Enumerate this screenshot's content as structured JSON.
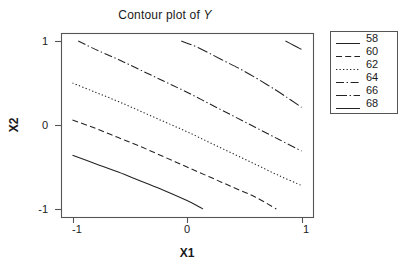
{
  "chart_data": {
    "type": "line",
    "title": "Contour plot of Y",
    "title_prefix": "Contour plot of ",
    "title_variable": "Y",
    "xlabel": "X1",
    "ylabel": "X2",
    "xlim": [
      -1.3,
      1.3
    ],
    "ylim": [
      -1.15,
      1.15
    ],
    "xticks": [
      -1,
      0,
      1
    ],
    "xtick_labels": [
      "-1",
      "0",
      "1"
    ],
    "yticks": [
      -1,
      0,
      1
    ],
    "ytick_labels": [
      "-1",
      "0",
      "1"
    ],
    "grid": false,
    "legend_position": "right-outside",
    "legend_title": "",
    "axis_color": "#555555",
    "line_color": "#222222",
    "background": "#ffffff",
    "contour_levels": [
      58,
      60,
      62,
      64,
      66,
      68
    ],
    "series": [
      {
        "name": "58",
        "level": 58,
        "dash": "solid",
        "points": [
          [
            -1.0,
            -0.36
          ],
          [
            -0.8,
            -0.46
          ],
          [
            -0.6,
            -0.56
          ],
          [
            -0.4,
            -0.67
          ],
          [
            -0.2,
            -0.78
          ],
          [
            0.0,
            -0.9
          ],
          [
            0.1,
            -0.97
          ],
          [
            0.14,
            -1.0
          ]
        ]
      },
      {
        "name": "60",
        "level": 60,
        "dash": "dashed",
        "points": [
          [
            -1.0,
            0.06
          ],
          [
            -0.8,
            -0.04
          ],
          [
            -0.6,
            -0.15
          ],
          [
            -0.4,
            -0.26
          ],
          [
            -0.2,
            -0.38
          ],
          [
            0.0,
            -0.5
          ],
          [
            0.2,
            -0.62
          ],
          [
            0.4,
            -0.74
          ],
          [
            0.6,
            -0.86
          ],
          [
            0.78,
            -1.0
          ]
        ]
      },
      {
        "name": "62",
        "level": 62,
        "dash": "dotted",
        "points": [
          [
            -1.0,
            0.5
          ],
          [
            -0.8,
            0.39
          ],
          [
            -0.6,
            0.28
          ],
          [
            -0.4,
            0.16
          ],
          [
            -0.2,
            0.04
          ],
          [
            0.0,
            -0.08
          ],
          [
            0.2,
            -0.21
          ],
          [
            0.4,
            -0.34
          ],
          [
            0.6,
            -0.47
          ],
          [
            0.8,
            -0.6
          ],
          [
            1.0,
            -0.72
          ]
        ]
      },
      {
        "name": "64",
        "level": 64,
        "dash": "dashdot",
        "points": [
          [
            -0.95,
            1.0
          ],
          [
            -0.8,
            0.9
          ],
          [
            -0.6,
            0.78
          ],
          [
            -0.4,
            0.65
          ],
          [
            -0.2,
            0.52
          ],
          [
            0.0,
            0.39
          ],
          [
            0.2,
            0.25
          ],
          [
            0.4,
            0.11
          ],
          [
            0.6,
            -0.03
          ],
          [
            0.8,
            -0.17
          ],
          [
            1.0,
            -0.31
          ]
        ]
      },
      {
        "name": "66",
        "level": 66,
        "dash": "longdashdot",
        "points": [
          [
            -0.05,
            1.0
          ],
          [
            0.1,
            0.92
          ],
          [
            0.3,
            0.78
          ],
          [
            0.5,
            0.64
          ],
          [
            0.7,
            0.48
          ],
          [
            0.85,
            0.35
          ],
          [
            1.0,
            0.21
          ]
        ]
      },
      {
        "name": "68",
        "level": 68,
        "dash": "solid",
        "points": [
          [
            0.86,
            1.0
          ],
          [
            0.93,
            0.95
          ],
          [
            1.0,
            0.9
          ]
        ]
      }
    ]
  },
  "legend": {
    "items": [
      {
        "label": "58",
        "dash": "solid"
      },
      {
        "label": "60",
        "dash": "dashed"
      },
      {
        "label": "62",
        "dash": "dotted"
      },
      {
        "label": "64",
        "dash": "dashdot"
      },
      {
        "label": "66",
        "dash": "longdashdot"
      },
      {
        "label": "68",
        "dash": "solid"
      }
    ]
  }
}
